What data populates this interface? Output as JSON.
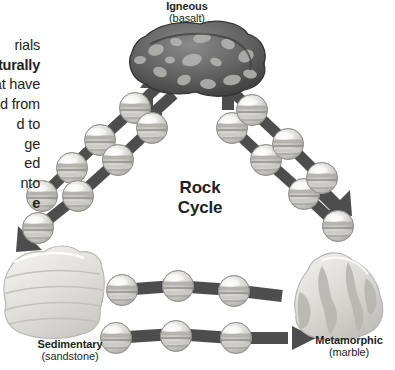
{
  "diagram": {
    "center_title": {
      "line1": "Rock",
      "line2": "Cycle"
    },
    "nodes": [
      {
        "id": "igneous",
        "name_label": "Igneous",
        "rock_label": "(basalt)",
        "color": "#6f6f6f"
      },
      {
        "id": "sedimentary",
        "name_label": "Sedimentary",
        "rock_label": "(sandstone)",
        "color": "#dedbd6"
      },
      {
        "id": "metamorphic",
        "name_label": "Metamorphic",
        "rock_label": "(marble)",
        "color": "#d2d1cd"
      }
    ],
    "side_text": {
      "lines": [
        {
          "text": "rials",
          "bold": false
        },
        {
          "text": "aturally",
          "bold": true
        },
        {
          "text": "at have",
          "bold": false
        },
        {
          "text": "d from",
          "bold": false
        },
        {
          "text": "d to",
          "bold": false
        },
        {
          "text": "ge",
          "bold": false
        },
        {
          "text": "ed",
          "bold": false
        },
        {
          "text": "nto",
          "bold": false
        },
        {
          "text": "e",
          "bold": true
        }
      ]
    },
    "chains": [
      {
        "id": "sedimentary-to-igneous",
        "beads": 4,
        "direction": "up-right",
        "arrow": "up"
      },
      {
        "id": "igneous-to-sedimentary",
        "beads": 4,
        "direction": "down-left",
        "arrow": "down-left"
      },
      {
        "id": "metamorphic-to-igneous",
        "beads": 4,
        "direction": "up-left",
        "arrow": "up"
      },
      {
        "id": "igneous-to-metamorphic",
        "beads": 4,
        "direction": "down-right",
        "arrow": "down-right"
      },
      {
        "id": "metamorphic-to-sedimentary",
        "beads": 3,
        "direction": "left",
        "arrow": "left"
      },
      {
        "id": "sedimentary-to-metamorphic",
        "beads": 3,
        "direction": "right",
        "arrow": "right"
      }
    ],
    "colors": {
      "arrow": "#4d4d4d",
      "bead_light": "#efeeec",
      "bead_mid": "#b9b8b6",
      "bead_dark": "#8d8c8a",
      "text": "#231f20",
      "igneous_rock": "#787878",
      "igneous_rock_dark": "#4a4a4a",
      "igneous_spots": "#b5b4b2",
      "sedimentary_rock": "#e4e2de",
      "metamorphic_rock": "#dedcd7"
    }
  }
}
